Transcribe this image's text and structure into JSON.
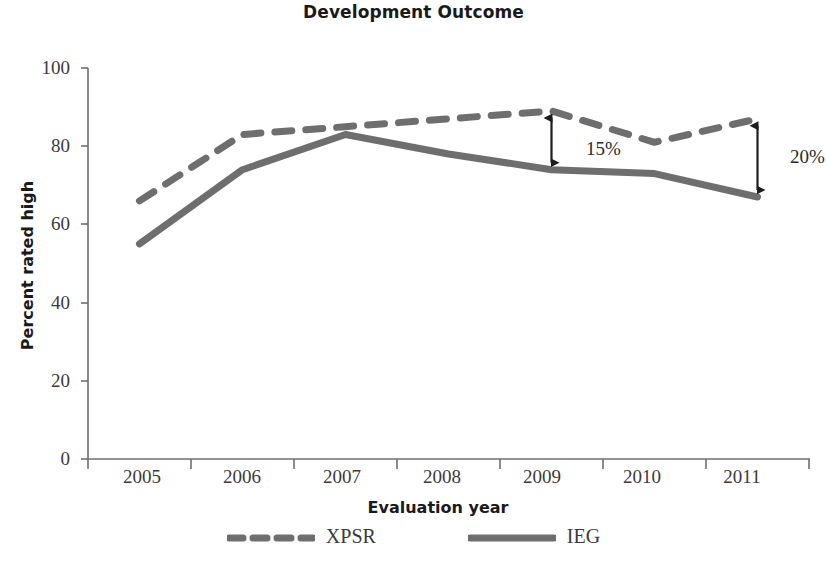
{
  "chart_data": {
    "type": "line",
    "title": "Development Outcome",
    "xlabel": "Evaluation year",
    "ylabel": "Percent rated high",
    "categories": [
      "2005",
      "2006",
      "2007",
      "2008",
      "2009",
      "2010",
      "2011"
    ],
    "ylim": [
      0,
      100
    ],
    "yticks": [
      "0",
      "20",
      "40",
      "60",
      "80",
      "100"
    ],
    "grid": false,
    "legend_position": "bottom",
    "series": [
      {
        "name": "XPSR",
        "style": "dashed",
        "color": "#6e6e6e",
        "values": [
          66,
          83,
          85,
          87,
          89,
          81,
          87
        ]
      },
      {
        "name": "IEG",
        "style": "solid",
        "color": "#6e6e6e",
        "values": [
          55,
          74,
          83,
          78,
          74,
          73,
          67
        ]
      }
    ],
    "annotations": [
      {
        "label": "15%",
        "at_category": "2009",
        "from": 74,
        "to": 89
      },
      {
        "label": "20%",
        "at_category": "2011",
        "from": 67,
        "to": 87
      }
    ]
  },
  "axis": {
    "y_ticks": [
      {
        "value": "100"
      },
      {
        "value": "80"
      },
      {
        "value": "60"
      },
      {
        "value": "40"
      },
      {
        "value": "20"
      },
      {
        "value": "0"
      }
    ],
    "x_ticks": [
      {
        "value": "2005"
      },
      {
        "value": "2006"
      },
      {
        "value": "2007"
      },
      {
        "value": "2008"
      },
      {
        "value": "2009"
      },
      {
        "value": "2010"
      },
      {
        "value": "2011"
      }
    ]
  },
  "legend": {
    "entries": [
      {
        "label": "XPSR"
      },
      {
        "label": "IEG"
      }
    ]
  },
  "annotations": [
    {
      "label": "15%"
    },
    {
      "label": "20%"
    }
  ]
}
